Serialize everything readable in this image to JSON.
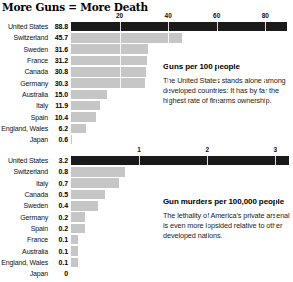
{
  "page": {
    "title": "More Guns = More Death"
  },
  "chart_data": [
    {
      "type": "bar",
      "orientation": "horizontal",
      "title": "Guns per 100 people",
      "annotation": "The United States stands alone among developed countries: It has by far the highest rate of firearms ownership.",
      "categories": [
        "United States",
        "Switzerland",
        "Sweden",
        "France",
        "Canada",
        "Germany",
        "Australia",
        "Italy",
        "Spain",
        "England, Wales",
        "Japan"
      ],
      "values": [
        88.8,
        45.7,
        31.6,
        31.2,
        30.8,
        30.3,
        15.0,
        11.9,
        10.4,
        6.2,
        0.6
      ],
      "value_labels": [
        "88.8",
        "45.7",
        "31.6",
        "31.2",
        "30.8",
        "30.3",
        "15.0",
        "11.9",
        "10.4",
        "6.2",
        "0.6"
      ],
      "ticks": [
        20,
        40,
        60,
        80
      ],
      "xlim": [
        0,
        91.4
      ],
      "grid": true,
      "highlight_index": 0,
      "colors": {
        "highlight_bar": "#1a1a1a",
        "bar": "#c6c6c6",
        "gridline": "#ffffff"
      }
    },
    {
      "type": "bar",
      "orientation": "horizontal",
      "title": "Gun murders per 100,000 people",
      "annotation": "The lethality of America's private arsenal is even more lopsided relative to other developed nations.",
      "categories": [
        "United States",
        "Switzerland",
        "Italy",
        "Canada",
        "Sweden",
        "Germany",
        "Spain",
        "France",
        "Australia",
        "England, Wales",
        "Japan"
      ],
      "values": [
        3.2,
        0.8,
        0.7,
        0.5,
        0.4,
        0.2,
        0.2,
        0.1,
        0.1,
        0.1,
        0
      ],
      "value_labels": [
        "3.2",
        "0.8",
        "0.7",
        "0.5",
        "0.4",
        "0.2",
        "0.2",
        "0.1",
        "0.1",
        "0.1",
        "0"
      ],
      "ticks": [
        1,
        2,
        3
      ],
      "xlim": [
        0,
        3.26
      ],
      "grid": true,
      "highlight_index": 0,
      "colors": {
        "highlight_bar": "#1a1a1a",
        "bar": "#c6c6c6",
        "gridline": "#ffffff"
      }
    }
  ]
}
